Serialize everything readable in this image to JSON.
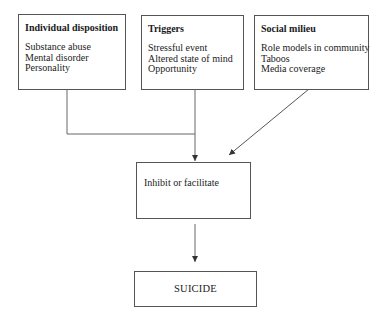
{
  "diagram": {
    "factors": [
      {
        "id": "individual-disposition",
        "title": "Individual disposition",
        "items": [
          "Substance abuse",
          "Mental disorder",
          "Personality"
        ]
      },
      {
        "id": "triggers",
        "title": "Triggers",
        "items": [
          "Stressful event",
          "Altered state of mind",
          "Opportunity"
        ]
      },
      {
        "id": "social-milieu",
        "title": "Social milieu",
        "items": [
          "Role models in community",
          "Taboos",
          "Media coverage"
        ]
      }
    ],
    "mediator": {
      "label": "Inhibit or facilitate"
    },
    "outcome": {
      "label": "SUICIDE"
    },
    "edges": [
      {
        "from": "individual-disposition",
        "to": "mediator",
        "style": "elbow-join"
      },
      {
        "from": "triggers",
        "to": "mediator",
        "style": "straight-arrow"
      },
      {
        "from": "social-milieu",
        "to": "mediator",
        "style": "diagonal-arrow"
      },
      {
        "from": "mediator",
        "to": "outcome",
        "style": "straight-arrow"
      }
    ],
    "colors": {
      "stroke": "#555555",
      "text": "#1a1a1a",
      "background": "#ffffff"
    }
  }
}
